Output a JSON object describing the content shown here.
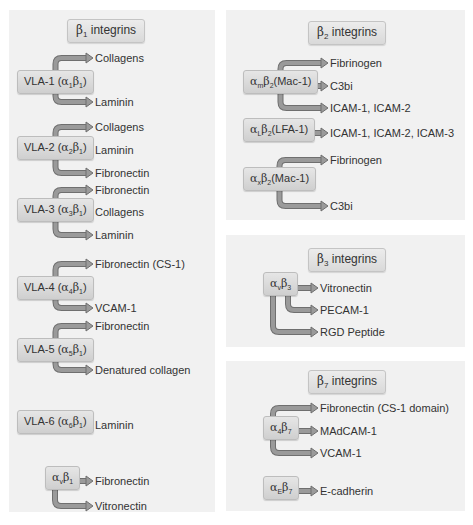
{
  "panels": [
    {
      "id": "b1",
      "header": "β1 integrins",
      "header_html_parts": [
        "β",
        "1",
        " integrins"
      ],
      "groups": [
        {
          "node": {
            "pre": "VLA-1 (",
            "a": "α",
            "asub": "1",
            "b": "β",
            "bsub": "1",
            "post": ")"
          },
          "ligands": [
            "Collagens",
            "Laminin"
          ],
          "pattern": "top-bottom"
        },
        {
          "node": {
            "pre": "VLA-2 (",
            "a": "α",
            "asub": "2",
            "b": "β",
            "bsub": "1",
            "post": ")"
          },
          "ligands": [
            "Collagens",
            "Laminin",
            "Fibronectin"
          ],
          "pattern": "top-mid-bottom"
        },
        {
          "node": {
            "pre": "VLA-3 (",
            "a": "α",
            "asub": "3",
            "b": "β",
            "bsub": "1",
            "post": ")"
          },
          "ligands": [
            "Fibronectin",
            "Collagens",
            "Laminin"
          ],
          "pattern": "top-mid-bottom"
        },
        {
          "node": {
            "pre": "VLA-4 (",
            "a": "α",
            "asub": "4",
            "b": "β",
            "bsub": "1",
            "post": ")"
          },
          "ligands": [
            "Fibronectin (CS-1)",
            "VCAM-1"
          ],
          "pattern": "top-bottom"
        },
        {
          "node": {
            "pre": "VLA-5 (",
            "a": "α",
            "asub": "5",
            "b": "β",
            "bsub": "1",
            "post": ")"
          },
          "ligands": [
            "Fibronectin",
            "Denatured collagen"
          ],
          "pattern": "top-bottom"
        },
        {
          "node": {
            "pre": "VLA-6 (",
            "a": "α",
            "asub": "6",
            "b": "β",
            "bsub": "1",
            "post": ")"
          },
          "ligands": [
            "Laminin"
          ],
          "pattern": "mid"
        },
        {
          "node": {
            "pre": "",
            "a": "α",
            "asub": "v",
            "b": "β",
            "bsub": "1",
            "post": ""
          },
          "ligands": [
            "Fibronectin",
            "Vitronectin"
          ],
          "pattern": "mid-bottom"
        }
      ]
    },
    {
      "id": "b2",
      "header_html_parts": [
        "β",
        "2",
        " integrins"
      ],
      "groups": [
        {
          "node": {
            "pre": "",
            "a": "α",
            "asub": "m",
            "b": "β",
            "bsub": "2",
            "post": "(Mac-1)"
          },
          "ligands": [
            "Fibrinogen",
            "C3bi",
            "ICAM-1, ICAM-2"
          ],
          "pattern": "top-mid-bottom"
        },
        {
          "node": {
            "pre": "",
            "a": "α",
            "asub": "L",
            "b": "β",
            "bsub": "2",
            "post": "(LFA-1)"
          },
          "ligands": [
            "ICAM-1, ICAM-2, ICAM-3"
          ],
          "pattern": "mid"
        },
        {
          "node": {
            "pre": "",
            "a": "α",
            "asub": "x",
            "b": "β",
            "bsub": "2",
            "post": "(Mac-1)"
          },
          "ligands": [
            "Fibrinogen",
            "C3bi"
          ],
          "pattern": "top-bottom"
        }
      ]
    },
    {
      "id": "b3",
      "header_html_parts": [
        "β",
        "3",
        " integrins"
      ],
      "groups": [
        {
          "node": {
            "pre": "",
            "a": "α",
            "asub": "v",
            "b": "β",
            "bsub": "3",
            "post": ""
          },
          "ligands": [
            "Vitronectin",
            "PECAM-1",
            "RGD Peptide"
          ],
          "pattern": "mid-inner-outer"
        }
      ]
    },
    {
      "id": "b7",
      "header_html_parts": [
        "β",
        "7",
        " integrins"
      ],
      "groups": [
        {
          "node": {
            "pre": "",
            "a": "α",
            "asub": "4",
            "b": "β",
            "bsub": "7",
            "post": ""
          },
          "ligands": [
            "Fibronectin (CS-1 domain)",
            "MAdCAM-1",
            "VCAM-1"
          ],
          "pattern": "top-mid-bottom"
        },
        {
          "node": {
            "pre": "",
            "a": "α",
            "asub": "E",
            "b": "β",
            "bsub": "7",
            "post": ""
          },
          "ligands": [
            "E-cadherin"
          ],
          "pattern": "mid"
        }
      ]
    }
  ],
  "colors": {
    "panel_bg": "#f1f1f1",
    "arrow_fill": "#9a9a9a",
    "arrow_edge": "#6f6f6f",
    "node_bg": "#d8d8d8",
    "text": "#333333"
  }
}
